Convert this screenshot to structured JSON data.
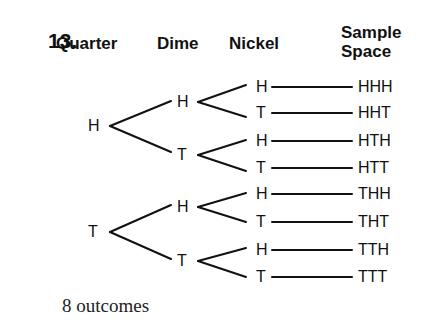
{
  "problem_number": "13.",
  "headers": {
    "quarter": "Quarter",
    "dime": "Dime",
    "nickel": "Nickel",
    "sample_space_line1": "Sample",
    "sample_space_line2": "Space"
  },
  "tree": {
    "quarter": [
      "H",
      "T"
    ],
    "dime": [
      "H",
      "T",
      "H",
      "T"
    ],
    "nickel": [
      "H",
      "T",
      "H",
      "T",
      "H",
      "T",
      "H",
      "T"
    ]
  },
  "sample_space": [
    "HHH",
    "HHT",
    "HTH",
    "HTT",
    "THH",
    "THT",
    "TTH",
    "TTT"
  ],
  "footer": "8 outcomes"
}
